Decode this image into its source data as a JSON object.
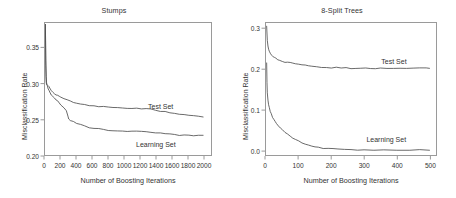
{
  "figure": {
    "width": 456,
    "height": 198,
    "background": "#ffffff",
    "line_color": "#4d4d4d",
    "axis_color": "#9a9a9a",
    "text_color": "#333333"
  },
  "chart_data": [
    {
      "type": "line",
      "title": "Stumps",
      "xlabel": "Number of Boosting Iterations",
      "ylabel": "Misclassification Rate",
      "xlim": [
        0,
        2100
      ],
      "ylim": [
        0.2,
        0.385
      ],
      "xticks": [
        0,
        200,
        400,
        600,
        800,
        1000,
        1200,
        1400,
        1600,
        1800,
        2000
      ],
      "xticklabels": [
        "0",
        "200",
        "400",
        "600",
        "800",
        "1000",
        "1200",
        "1400",
        "1600",
        "1800",
        "2000"
      ],
      "yticks": [
        0.2,
        0.25,
        0.3,
        0.35
      ],
      "yticklabels": [
        "0.20",
        "0.25",
        "0.30",
        "0.35"
      ],
      "grid": false,
      "legend_position": "inline-annotations",
      "annotations": [
        {
          "text": "Test Set",
          "x": 1500,
          "y": 0.268
        },
        {
          "text": "Learning Set",
          "x": 1350,
          "y": 0.2155
        }
      ],
      "series": [
        {
          "name": "Test Set",
          "x": [
            5,
            10,
            15,
            20,
            25,
            30,
            40,
            50,
            60,
            80,
            100,
            120,
            140,
            160,
            180,
            200,
            240,
            280,
            320,
            360,
            400,
            450,
            500,
            560,
            620,
            680,
            740,
            800,
            860,
            920,
            980,
            1040,
            1100,
            1160,
            1220,
            1280,
            1340,
            1400,
            1460,
            1520,
            1580,
            1640,
            1700,
            1760,
            1820,
            1880,
            1940,
            2000
          ],
          "y": [
            0.383,
            0.333,
            0.31,
            0.301,
            0.299,
            0.2985,
            0.297,
            0.2955,
            0.2935,
            0.2905,
            0.2875,
            0.2855,
            0.2845,
            0.2835,
            0.2825,
            0.2815,
            0.2795,
            0.2775,
            0.2755,
            0.2735,
            0.2725,
            0.2715,
            0.2705,
            0.2695,
            0.2685,
            0.268,
            0.2675,
            0.267,
            0.2665,
            0.2665,
            0.266,
            0.2655,
            0.2655,
            0.2655,
            0.265,
            0.2645,
            0.264,
            0.2625,
            0.2615,
            0.2605,
            0.2595,
            0.2585,
            0.2575,
            0.2565,
            0.256,
            0.2555,
            0.2545,
            0.2535
          ]
        },
        {
          "name": "Learning Set",
          "x": [
            5,
            10,
            15,
            20,
            25,
            30,
            40,
            50,
            60,
            80,
            100,
            120,
            140,
            160,
            180,
            200,
            240,
            270,
            290,
            300,
            320,
            360,
            400,
            450,
            500,
            560,
            620,
            680,
            740,
            800,
            860,
            920,
            980,
            1040,
            1100,
            1160,
            1220,
            1280,
            1340,
            1400,
            1460,
            1520,
            1580,
            1640,
            1700,
            1760,
            1820,
            1880,
            1940,
            2000
          ],
          "y": [
            0.383,
            0.325,
            0.302,
            0.2985,
            0.2975,
            0.2965,
            0.293,
            0.2905,
            0.2885,
            0.2845,
            0.2815,
            0.2795,
            0.2775,
            0.2755,
            0.2725,
            0.2705,
            0.2665,
            0.2625,
            0.2545,
            0.2505,
            0.2485,
            0.2465,
            0.2445,
            0.2425,
            0.2405,
            0.2385,
            0.2375,
            0.2365,
            0.2355,
            0.2345,
            0.2335,
            0.2335,
            0.2335,
            0.2335,
            0.2335,
            0.2335,
            0.2335,
            0.2325,
            0.2315,
            0.2305,
            0.2305,
            0.2295,
            0.2295,
            0.2285,
            0.2275,
            0.2275,
            0.2275,
            0.2275,
            0.2275,
            0.2275
          ]
        }
      ]
    },
    {
      "type": "line",
      "title": "8-Split Trees",
      "xlabel": "Number of Boosting Iterations",
      "ylabel": "Misclassification Rate",
      "xlim": [
        0,
        520
      ],
      "ylim": [
        -0.012,
        0.315
      ],
      "xticks": [
        0,
        100,
        200,
        300,
        400,
        500
      ],
      "xticklabels": [
        "0",
        "100",
        "200",
        "300",
        "400",
        "500"
      ],
      "yticks": [
        0.0,
        0.1,
        0.2,
        0.3
      ],
      "yticklabels": [
        "0.0",
        "0.1",
        "0.2",
        "0.3"
      ],
      "grid": false,
      "legend_position": "inline-annotations",
      "annotations": [
        {
          "text": "Test Set",
          "x": 400,
          "y": 0.218
        },
        {
          "text": "Learning Set",
          "x": 355,
          "y": 0.028
        }
      ],
      "series": [
        {
          "name": "Test Set",
          "x": [
            2,
            4,
            6,
            8,
            10,
            14,
            18,
            22,
            26,
            30,
            36,
            42,
            50,
            58,
            66,
            74,
            82,
            90,
            100,
            110,
            120,
            130,
            140,
            155,
            170,
            185,
            200,
            215,
            230,
            245,
            260,
            275,
            290,
            305,
            320,
            335,
            350,
            370,
            390,
            410,
            430,
            450,
            470,
            490,
            500
          ],
          "y": [
            0.307,
            0.272,
            0.258,
            0.25,
            0.245,
            0.239,
            0.234,
            0.231,
            0.229,
            0.227,
            0.2245,
            0.2225,
            0.2205,
            0.2185,
            0.2175,
            0.2165,
            0.2155,
            0.2145,
            0.2125,
            0.2115,
            0.2105,
            0.2095,
            0.2085,
            0.2065,
            0.2055,
            0.2045,
            0.2035,
            0.2045,
            0.2025,
            0.2035,
            0.2025,
            0.2035,
            0.2025,
            0.2035,
            0.2025,
            0.2025,
            0.2035,
            0.2025,
            0.2035,
            0.2025,
            0.2035,
            0.2025,
            0.2035,
            0.2035,
            0.2035
          ]
        },
        {
          "name": "Learning Set",
          "x": [
            2,
            3,
            4,
            6,
            8,
            10,
            13,
            16,
            20,
            24,
            28,
            32,
            38,
            44,
            50,
            58,
            66,
            74,
            82,
            90,
            100,
            110,
            120,
            130,
            140,
            150,
            160,
            175,
            190,
            205,
            220,
            240,
            260,
            280,
            300,
            330,
            360,
            400,
            440,
            470,
            500
          ],
          "y": [
            0.216,
            0.168,
            0.142,
            0.124,
            0.112,
            0.105,
            0.096,
            0.09,
            0.082,
            0.076,
            0.071,
            0.066,
            0.06,
            0.055,
            0.05,
            0.044,
            0.039,
            0.034,
            0.03,
            0.026,
            0.022,
            0.018,
            0.015,
            0.012,
            0.01,
            0.008,
            0.0065,
            0.005,
            0.004,
            0.003,
            0.0025,
            0.002,
            0.0015,
            0.001,
            0.001,
            0.0008,
            0.0006,
            0.0005,
            0.0004,
            0.0003,
            0.0003
          ]
        }
      ]
    }
  ]
}
